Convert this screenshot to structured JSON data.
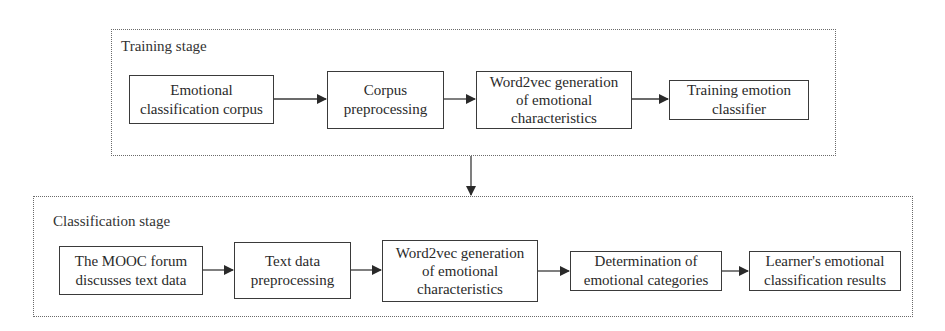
{
  "training_stage": {
    "label": "Training stage",
    "steps": [
      {
        "line1": "Emotional",
        "line2": "classification corpus",
        "line3": ""
      },
      {
        "line1": "Corpus",
        "line2": "preprocessing",
        "line3": ""
      },
      {
        "line1": "Word2vec generation",
        "line2": "of emotional",
        "line3": "characteristics"
      },
      {
        "line1": "Training emotion",
        "line2": "classifier",
        "line3": ""
      }
    ]
  },
  "classification_stage": {
    "label": "Classification stage",
    "steps": [
      {
        "line1": "The MOOC forum",
        "line2": "discusses text data",
        "line3": ""
      },
      {
        "line1": "Text data",
        "line2": "preprocessing",
        "line3": ""
      },
      {
        "line1": "Word2vec generation",
        "line2": "of emotional",
        "line3": "characteristics"
      },
      {
        "line1": "Determination of",
        "line2": "emotional categories",
        "line3": ""
      },
      {
        "line1": "Learner's emotional",
        "line2": "classification results",
        "line3": ""
      }
    ]
  },
  "colors": {
    "line": "#3a3a3a",
    "dotted_border": "#6a6a6a",
    "text": "#2a2a2a",
    "background": "#ffffff"
  }
}
